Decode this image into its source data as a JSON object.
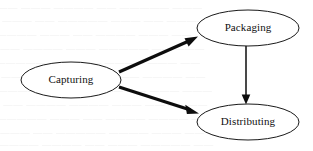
{
  "diagram": {
    "background_color": "#ffffff",
    "node_stroke_color": "#1a1a1a",
    "edge_color": "#0d0d0d",
    "label_color": "#101010",
    "nodes": [
      {
        "id": "capturing",
        "label": "Capturing",
        "shape": "ellipse",
        "cx": 71,
        "cy": 80,
        "rx": 50,
        "ry": 18
      },
      {
        "id": "packaging",
        "label": "Packaging",
        "shape": "ellipse",
        "cx": 248,
        "cy": 28,
        "rx": 51,
        "ry": 18
      },
      {
        "id": "distributing",
        "label": "Distributing",
        "shape": "ellipse",
        "cx": 248,
        "cy": 122,
        "rx": 51,
        "ry": 18
      }
    ],
    "edges": [
      {
        "id": "capturing-to-packaging",
        "from": "capturing",
        "to": "packaging",
        "style": "thick",
        "x1": 119,
        "y1": 72,
        "x2": 198,
        "y2": 37
      },
      {
        "id": "capturing-to-distributing",
        "from": "capturing",
        "to": "distributing",
        "style": "thick",
        "x1": 119,
        "y1": 87,
        "x2": 199,
        "y2": 113
      },
      {
        "id": "packaging-to-distributing",
        "from": "packaging",
        "to": "distributing",
        "style": "thin",
        "x1": 246,
        "y1": 46,
        "x2": 246,
        "y2": 104
      }
    ]
  },
  "background_artifacts": {
    "description": "faint illegible scan bleed-through text",
    "visible": true
  }
}
